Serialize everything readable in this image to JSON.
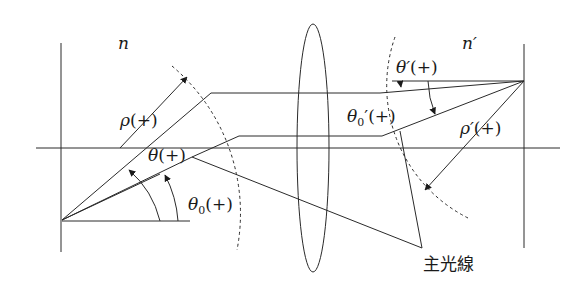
{
  "diagram": {
    "type": "optical-ray-diagram",
    "labels": {
      "object_medium": "n",
      "image_medium": "n′",
      "rho": "ρ",
      "rho_sign": "(+)",
      "theta": "θ",
      "theta_sign": "(+)",
      "theta0": "θ",
      "theta0_sub": "0",
      "theta0_sign": "(+)",
      "theta_prime": "θ′",
      "theta_prime_sign": "(+)",
      "theta0_prime": "θ",
      "theta0_prime_sub": "0",
      "theta0_prime_mark": "′",
      "theta0_prime_sign": "(+)",
      "rho_prime": "ρ′",
      "rho_prime_sign": "(+)",
      "principal_ray": "主光線"
    },
    "colors": {
      "line": "#2a2a2a",
      "background": "#ffffff"
    }
  }
}
